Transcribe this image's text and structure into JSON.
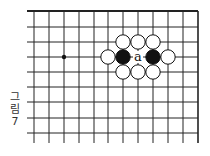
{
  "caption": {
    "line1": "그",
    "line2": "림",
    "line3": "7"
  },
  "board": {
    "columns_x": [
      34,
      49,
      64,
      79,
      94,
      108,
      123,
      138,
      153,
      168,
      183,
      198
    ],
    "rows_y": [
      11,
      27,
      42,
      57,
      72,
      87,
      102,
      118,
      133
    ],
    "line_left": 27,
    "line_bottom": 143,
    "line_color": "#222222",
    "star_points": [
      {
        "x": 64,
        "y": 57
      }
    ],
    "stones": [
      {
        "color": "white",
        "x": 123,
        "y": 42
      },
      {
        "color": "white",
        "x": 138,
        "y": 42
      },
      {
        "color": "white",
        "x": 153,
        "y": 42
      },
      {
        "color": "white",
        "x": 108,
        "y": 57
      },
      {
        "color": "black",
        "x": 123,
        "y": 57
      },
      {
        "color": "black",
        "x": 153,
        "y": 57
      },
      {
        "color": "white",
        "x": 168,
        "y": 57
      },
      {
        "color": "white",
        "x": 123,
        "y": 72
      },
      {
        "color": "white",
        "x": 138,
        "y": 72
      },
      {
        "color": "white",
        "x": 153,
        "y": 72
      }
    ],
    "labels": [
      {
        "text": "a",
        "x": 138,
        "y": 57
      }
    ]
  }
}
